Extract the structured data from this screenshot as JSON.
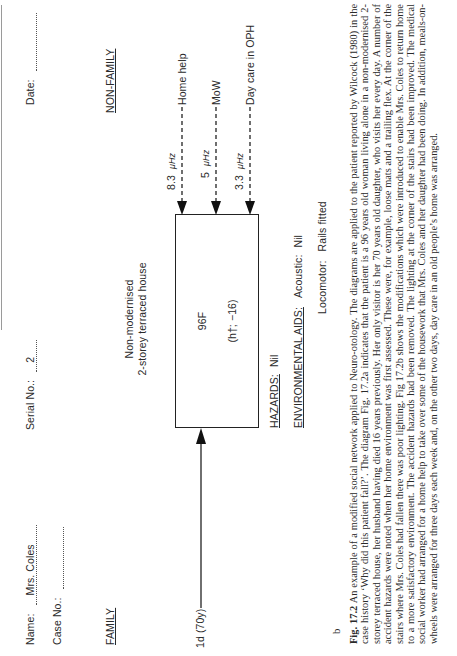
{
  "form": {
    "name_label": "Name:",
    "name_value": "Mrs. Coles",
    "case_label": "Case No.:",
    "case_value": "",
    "serial_label": "Serial No.:",
    "serial_value": "2",
    "date_label": "Date:",
    "date_value": "",
    "family_heading": "FAMILY",
    "nonfamily_heading": "NON-FAMILY"
  },
  "diagram": {
    "house_line1": "Non-modernised",
    "house_line2": "2-storey terraced house",
    "box_line1": "96F",
    "box_line2": "(h†; −16)",
    "family_link": {
      "label": "1d (70y)"
    },
    "services": [
      {
        "value": "8.3",
        "unit": "μHz",
        "label": "Home help"
      },
      {
        "value": "5",
        "unit": "μHz",
        "label": "MoW"
      },
      {
        "value": "3.3",
        "unit": "μHz",
        "label": "Day care in OPH"
      }
    ],
    "hazards_label": "HAZARDS:",
    "hazards_value": "Nil",
    "env_aids_label": "ENVIRONMENTAL AIDS:",
    "acoustic_label": "Acoustic:",
    "acoustic_value": "Nil",
    "locomotor_label": "Locomotor:",
    "locomotor_value": "Rails fitted"
  },
  "panel_label": "b",
  "caption": {
    "fig_label": "Fig. 17.2",
    "text": "An example of a modified social network applied to Neuro-otology. The diagrams are applied to the patient reported by Wilcock (1980) in the case history ‘Why did this patient fall?’. The diagram Fig. 17.2a indicates that the patient is a 96 years old woman living alone in a non-modernised 2-storey terraced house, her husband having died 16 years previously. Her only visitor is her 70 years old daughter, who visits her every day. A number of accident hazards were noted when her home environment was first assessed. These were, for example, loose mats and a trailing flex. At the corner of the stairs where Mrs. Coles had fallen there was poor lighting. Fig 17.2b shows the modifications which were introduced to enable Mrs. Coles to return home to a more satisfactory environment. The accident hazards had been removed. The lighting at the corner of the stairs had been improved. The medical social worker had arranged for a home help to take over some of the housework that Mrs. Coles and her daughter had been doing. In addition, meals-on-wheels were arranged for three days each week and, on the other two days, day care in an old people’s home was arranged."
  }
}
